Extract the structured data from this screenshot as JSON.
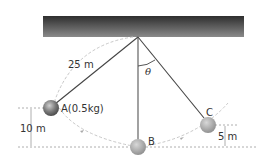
{
  "diagram": {
    "string_length_label": "25 m",
    "angle_label": "θ",
    "points": {
      "A": {
        "label": "A(0.5kg)"
      },
      "B": {
        "label": "B"
      },
      "C": {
        "label": "C"
      }
    },
    "heights": {
      "A_height_label": "10 m",
      "C_height_label": "5 m"
    },
    "colors": {
      "ceiling_dark": "#2e2e2e",
      "ceiling_light": "#8a8a8a",
      "string": "#444444",
      "ball": "#9a9a9a",
      "ball_dark": "#555555",
      "dashed": "#9a9a9a",
      "path": "#c8c8c8"
    }
  }
}
